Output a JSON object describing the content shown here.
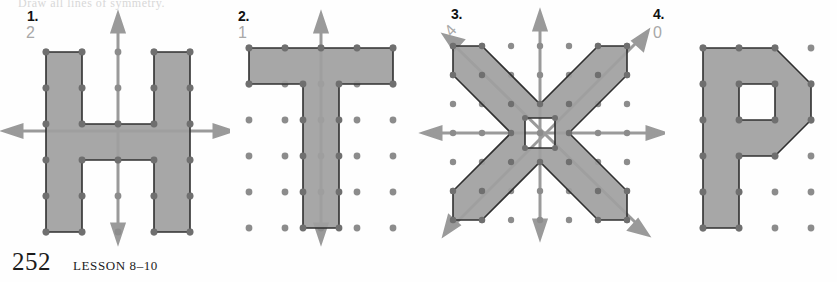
{
  "page": {
    "page_number": "252",
    "lesson_label": "LESSON 8–10",
    "cut_off_header": "Draw all lines of symmetry.",
    "colors": {
      "figure_fill": "#a0a0a0",
      "figure_stroke": "#303030",
      "dot_color": "#8c8c8c",
      "axis_color": "#9a9a9a",
      "answer_color": "#a8a8a8",
      "label_color": "#111111",
      "background": "#fefefe"
    }
  },
  "figures": [
    {
      "number": "1.",
      "answer": "2",
      "letter": "H",
      "lines_of_symmetry": 2,
      "symmetry_axes": [
        "vertical",
        "horizontal"
      ],
      "grid_cols": 5,
      "grid_rows": 6,
      "has_hole": false
    },
    {
      "number": "2.",
      "answer": "1",
      "letter": "T",
      "lines_of_symmetry": 1,
      "symmetry_axes": [
        "vertical"
      ],
      "grid_cols": 5,
      "grid_rows": 6,
      "has_hole": false
    },
    {
      "number": "3.",
      "answer": "4",
      "letter": "X",
      "lines_of_symmetry": 4,
      "symmetry_axes": [
        "vertical",
        "horizontal",
        "diagonal-up",
        "diagonal-down"
      ],
      "grid_cols": 7,
      "grid_rows": 7,
      "has_hole": true
    },
    {
      "number": "4.",
      "answer": "0",
      "letter": "P",
      "lines_of_symmetry": 0,
      "symmetry_axes": [],
      "grid_cols": 5,
      "grid_rows": 6,
      "has_hole": true
    }
  ]
}
